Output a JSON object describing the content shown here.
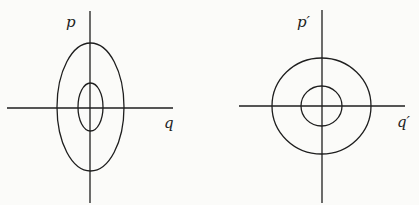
{
  "figure": {
    "panels": [
      {
        "name": "original-phase-space",
        "axes": {
          "x_label": "q",
          "y_label": "p"
        },
        "description": "Two concentric ellipses elongated along p axis",
        "contours": [
          "outer-ellipse",
          "inner-ellipse"
        ]
      },
      {
        "name": "transformed-phase-space",
        "axes": {
          "x_label": "q′",
          "y_label": "p′"
        },
        "description": "Two concentric circles",
        "contours": [
          "outer-circle",
          "inner-circle"
        ]
      }
    ]
  },
  "colors": {
    "ink": "#1e1e1e",
    "paper": "#fbfbf9"
  }
}
